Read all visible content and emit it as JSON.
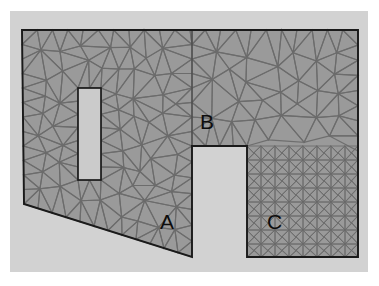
{
  "figure": {
    "kind": "finite-element-mesh-diagram",
    "background_color": "#ffffff",
    "panel_color": "#d2d2d2",
    "mesh_fill_color": "#9a9a9a",
    "mesh_edge_color": "#6b6b6b",
    "boundary_color": "#1a1a1a",
    "hole_fill_color": "#cbcbcb",
    "label_color": "#0d0d0d"
  },
  "panel": {
    "x": 10,
    "y": 11,
    "width": 358,
    "height": 261
  },
  "regions": [
    {
      "id": "A",
      "label": "A",
      "label_x": 160,
      "label_y": 211,
      "mesh_type": "unstructured-triangular",
      "density": "medium"
    },
    {
      "id": "B",
      "label": "B",
      "label_x": 200,
      "label_y": 111,
      "mesh_type": "unstructured-triangular",
      "density": "coarse"
    },
    {
      "id": "C",
      "label": "C",
      "label_x": 267,
      "label_y": 211,
      "mesh_type": "structured-grid-triangular",
      "density": "fine"
    }
  ],
  "domain": {
    "outline": [
      [
        22,
        30
      ],
      [
        358,
        30
      ],
      [
        358,
        257
      ],
      [
        247,
        257
      ],
      [
        247,
        146
      ],
      [
        192,
        146
      ],
      [
        192,
        257
      ],
      [
        24,
        204
      ]
    ],
    "interior_divider": [
      [
        192,
        30
      ],
      [
        192,
        146
      ]
    ],
    "hole": {
      "x": 78,
      "y": 88,
      "width": 23,
      "height": 92
    }
  },
  "mesh": {
    "structured_cell_size": 14,
    "structured_region": {
      "x": 247,
      "y": 146,
      "width": 111,
      "height": 111
    },
    "unstructured_seed": 20240601
  }
}
